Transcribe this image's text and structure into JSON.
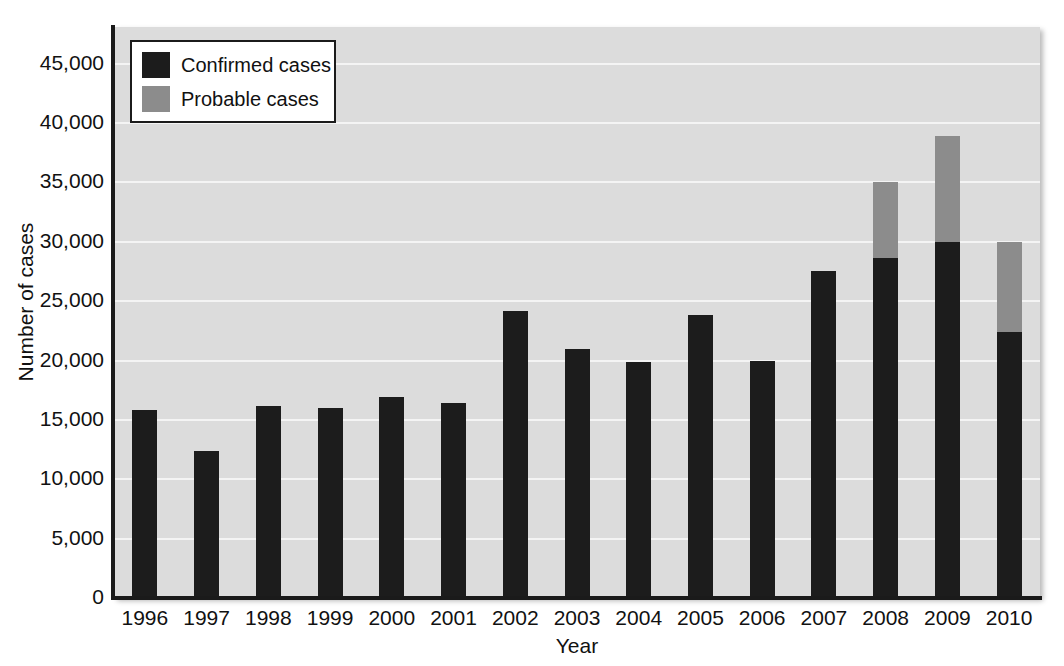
{
  "chart_data": {
    "type": "bar",
    "title": "",
    "subtitle": "",
    "xlabel": "Year",
    "ylabel": "Number of cases",
    "stacked": true,
    "grid": true,
    "legend_position": "top-left",
    "ylim": [
      0,
      48000
    ],
    "ytick_values": [
      0,
      5000,
      10000,
      15000,
      20000,
      25000,
      30000,
      35000,
      40000,
      45000
    ],
    "ytick_labels": [
      "0",
      "5,000",
      "10,000",
      "15,000",
      "20,000",
      "25,000",
      "30,000",
      "35,000",
      "40,000",
      "45,000"
    ],
    "categories": [
      "1996",
      "1997",
      "1998",
      "1999",
      "2000",
      "2001",
      "2002",
      "2003",
      "2004",
      "2005",
      "2006",
      "2007",
      "2008",
      "2009",
      "2010"
    ],
    "series": [
      {
        "name": "Confirmed cases",
        "color": "#1c1c1c",
        "values": [
          15800,
          12400,
          16200,
          16000,
          16900,
          16400,
          24200,
          21000,
          19900,
          23800,
          20000,
          27500,
          28600,
          30000,
          22400
        ]
      },
      {
        "name": "Probable cases",
        "color": "#8c8c8c",
        "values": [
          0,
          0,
          0,
          0,
          0,
          0,
          0,
          0,
          0,
          0,
          0,
          0,
          6400,
          8900,
          7600
        ]
      }
    ],
    "totals": [
      15800,
      12400,
      16200,
      16000,
      16900,
      16400,
      24200,
      21000,
      19900,
      23800,
      20000,
      27500,
      35000,
      38900,
      30000
    ]
  },
  "legend": {
    "entries": [
      {
        "label": "Confirmed cases",
        "color": "#1c1c1c",
        "swatch_name": "legend-swatch-confirmed"
      },
      {
        "label": "Probable cases",
        "color": "#8c8c8c",
        "swatch_name": "legend-swatch-probable"
      }
    ]
  },
  "colors": {
    "plot_background": "#dcdcdc",
    "gridline": "#f4f4f4",
    "axis": "#1a1a1a",
    "confirmed": "#1c1c1c",
    "probable": "#8c8c8c",
    "page_background": "#ffffff"
  }
}
